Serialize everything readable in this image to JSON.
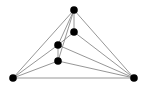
{
  "diagram": {
    "type": "graph",
    "width": 147,
    "height": 86,
    "edge_color": "#8a8a8a",
    "node_color": "#000000",
    "node_radius": 3.8,
    "nodes": [
      {
        "id": "top",
        "x": 74,
        "y": 10
      },
      {
        "id": "upper-right-inner",
        "x": 74,
        "y": 32
      },
      {
        "id": "middle-left-inner",
        "x": 58,
        "y": 45
      },
      {
        "id": "lower-inner",
        "x": 58,
        "y": 61
      },
      {
        "id": "bottom-left",
        "x": 13,
        "y": 78
      },
      {
        "id": "bottom-right",
        "x": 134,
        "y": 78
      }
    ],
    "edges": [
      [
        "top",
        "bottom-left"
      ],
      [
        "top",
        "bottom-right"
      ],
      [
        "top",
        "upper-right-inner"
      ],
      [
        "top",
        "middle-left-inner"
      ],
      [
        "top",
        "lower-inner"
      ],
      [
        "upper-right-inner",
        "middle-left-inner"
      ],
      [
        "upper-right-inner",
        "bottom-right"
      ],
      [
        "middle-left-inner",
        "lower-inner"
      ],
      [
        "middle-left-inner",
        "bottom-left"
      ],
      [
        "middle-left-inner",
        "bottom-right"
      ],
      [
        "lower-inner",
        "bottom-left"
      ],
      [
        "lower-inner",
        "bottom-right"
      ],
      [
        "bottom-left",
        "bottom-right"
      ]
    ]
  }
}
